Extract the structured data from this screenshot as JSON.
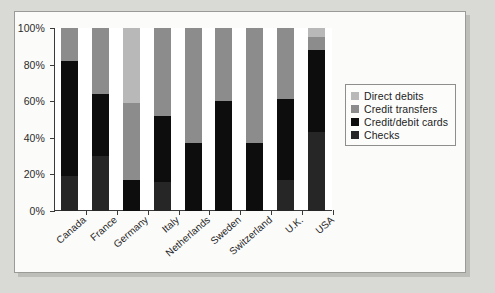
{
  "chart_data": {
    "type": "bar",
    "subtype": "stacked-bar-100-percent",
    "title": "",
    "xlabel": "",
    "ylabel": "",
    "ylim": [
      0,
      100
    ],
    "yticks": [
      "0%",
      "20%",
      "40%",
      "60%",
      "80%",
      "100%"
    ],
    "ytick_values": [
      0,
      20,
      40,
      60,
      80,
      100
    ],
    "grid": false,
    "legend_position": "right",
    "categories": [
      "Canada",
      "France",
      "Germany",
      "Italy",
      "Netherlands",
      "Sweden",
      "Switzerland",
      "U.K.",
      "USA"
    ],
    "series": [
      {
        "name": "Checks",
        "color": "#262626",
        "values": [
          19,
          30,
          0,
          16,
          0,
          0,
          0,
          17,
          43
        ]
      },
      {
        "name": "Credit/debit cards",
        "color": "#0d0d0d",
        "values": [
          63,
          34,
          17,
          36,
          37,
          60,
          37,
          44,
          45
        ]
      },
      {
        "name": "Credit transfers",
        "color": "#8c8c8c",
        "values": [
          18,
          36,
          42,
          48,
          63,
          40,
          63,
          39,
          7
        ]
      },
      {
        "name": "Direct debits",
        "color": "#b8b8b8",
        "values": [
          0,
          0,
          41,
          0,
          0,
          0,
          0,
          0,
          5
        ]
      }
    ],
    "stack_order_bottom_to_top": [
      "Checks",
      "Credit/debit cards",
      "Credit transfers",
      "Direct debits"
    ],
    "legend_entries": [
      {
        "label": "Direct debits",
        "color": "#b8b8b8"
      },
      {
        "label": "Credit transfers",
        "color": "#8c8c8c"
      },
      {
        "label": "Credit/debit cards",
        "color": "#0d0d0d"
      },
      {
        "label": "Checks",
        "color": "#262626"
      }
    ],
    "colors": {
      "direct_debits": "#b8b8b8",
      "credit_transfers": "#8c8c8c",
      "credit_debit_cards": "#0d0d0d",
      "checks": "#262626",
      "axis": "#3a3a3a",
      "plot_background": "#ffffff",
      "page_background": "#fbfbfa"
    }
  }
}
